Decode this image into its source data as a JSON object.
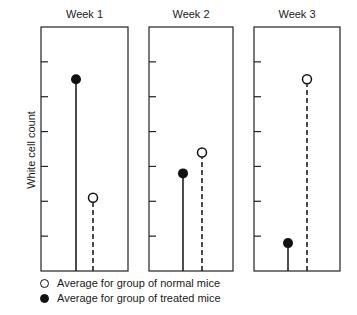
{
  "chart_data": {
    "type": "lollipop",
    "title": "",
    "ylabel": "White cell count",
    "xlabel": "",
    "ylim": [
      0,
      7
    ],
    "y_ticks_unlabeled": [
      1,
      2,
      3,
      4,
      5,
      6
    ],
    "grid": false,
    "panels": [
      {
        "label": "Week 1",
        "normal": 2.1,
        "treated": 5.5
      },
      {
        "label": "Week 2",
        "normal": 3.4,
        "treated": 2.8
      },
      {
        "label": "Week 3",
        "normal": 5.5,
        "treated": 0.8
      }
    ],
    "series": [
      {
        "name": "Average for group of normal mice",
        "marker": "open-circle",
        "line": "dashed",
        "values": [
          2.1,
          3.4,
          5.5
        ]
      },
      {
        "name": "Average for group of treated mice",
        "marker": "filled-circle",
        "line": "solid",
        "values": [
          5.5,
          2.8,
          0.8
        ]
      }
    ],
    "categories": [
      "Week 1",
      "Week 2",
      "Week 3"
    ],
    "legend_position": "bottom-left"
  },
  "legend": {
    "normal_label": "Average for group of normal mice",
    "treated_label": "Average for group of treated mice"
  },
  "colors": {
    "ink": "#111111",
    "frame": "#222222",
    "background": "#ffffff"
  }
}
